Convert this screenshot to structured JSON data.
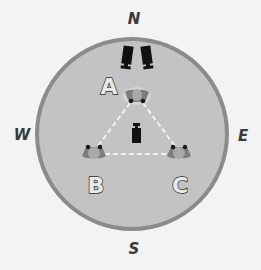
{
  "diagram": {
    "compass": {
      "north": "N",
      "south": "S",
      "west": "W",
      "east": "E"
    },
    "positions": [
      {
        "label": "A"
      },
      {
        "label": "B"
      },
      {
        "label": "C"
      }
    ],
    "colors": {
      "background": "#f3f3f3",
      "circle_fill": "#c3c3c3",
      "circle_border": "#8b8b8b",
      "triangle_line": "#ffffff",
      "speaker": "#111111"
    }
  }
}
